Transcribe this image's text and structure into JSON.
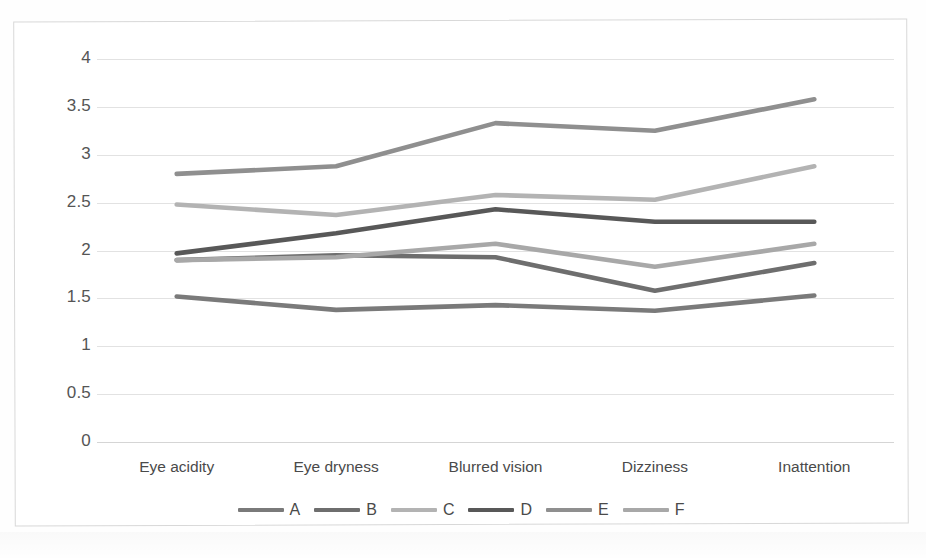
{
  "chart_data": {
    "type": "line",
    "title": "",
    "xlabel": "",
    "ylabel": "",
    "categories": [
      "Eye acidity",
      "Eye dryness",
      "Blurred vision",
      "Dizziness",
      "Inattention"
    ],
    "ylim": [
      0,
      4
    ],
    "yticks": [
      "0",
      "0.5",
      "1",
      "1.5",
      "2",
      "2.5",
      "3",
      "3.5",
      "4"
    ],
    "ytick_values": [
      0,
      0.5,
      1,
      1.5,
      2,
      2.5,
      3,
      3.5,
      4
    ],
    "grid": true,
    "legend_position": "bottom",
    "series": [
      {
        "name": "A",
        "color": "#7a7a7a",
        "values": [
          1.52,
          1.38,
          1.43,
          1.37,
          1.53
        ]
      },
      {
        "name": "B",
        "color": "#6e6e6e",
        "values": [
          1.9,
          1.95,
          1.93,
          1.58,
          1.87
        ]
      },
      {
        "name": "C",
        "color": "#b3b3b3",
        "values": [
          2.48,
          2.37,
          2.58,
          2.53,
          2.88
        ]
      },
      {
        "name": "D",
        "color": "#585858",
        "values": [
          1.97,
          2.18,
          2.43,
          2.3,
          2.3
        ]
      },
      {
        "name": "E",
        "color": "#8f8f8f",
        "values": [
          2.8,
          2.88,
          3.33,
          3.25,
          3.58
        ]
      },
      {
        "name": "F",
        "color": "#a8a8a8",
        "values": [
          1.9,
          1.93,
          2.07,
          1.83,
          2.07
        ]
      }
    ]
  },
  "colors": {
    "gridline": "#e2e2e2",
    "frame_border": "#d8d8d8",
    "axis_text": "#4a4a4a",
    "background": "#ffffff"
  }
}
